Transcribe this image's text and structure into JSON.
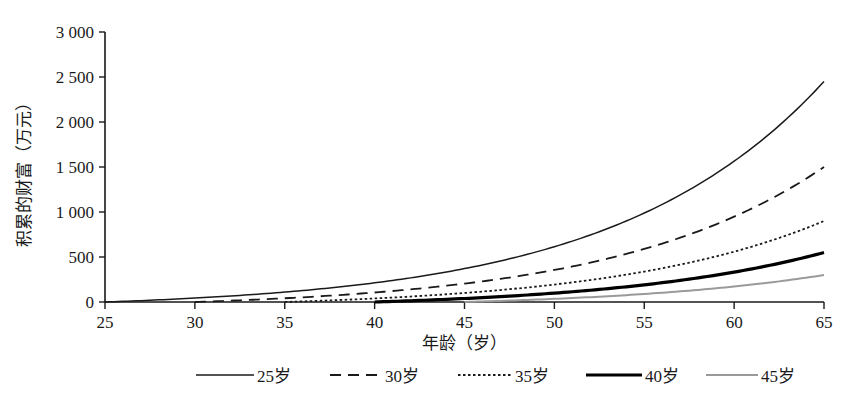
{
  "chart_data": {
    "type": "line",
    "title": "",
    "xlabel": "年龄（岁）",
    "ylabel": "积累的财富（万元）",
    "xlim": [
      25,
      65
    ],
    "ylim": [
      0,
      3000
    ],
    "grid": false,
    "legend_position": "bottom",
    "x_ticks": [
      "25",
      "30",
      "35",
      "40",
      "45",
      "50",
      "55",
      "60",
      "65"
    ],
    "x_tick_values": [
      25,
      30,
      35,
      40,
      45,
      50,
      55,
      60,
      65
    ],
    "y_ticks": [
      "0",
      "500",
      "1 000",
      "1 500",
      "2 000",
      "2 500",
      "3 000"
    ],
    "y_tick_values": [
      0,
      500,
      1000,
      1500,
      2000,
      2500,
      3000
    ],
    "x": [
      25,
      30,
      35,
      40,
      45,
      50,
      55,
      60,
      65
    ],
    "series": [
      {
        "name": "25岁",
        "style": "solid-thin",
        "color": "#1a1a1a",
        "start_age": 25,
        "values": [
          0,
          64,
          164,
          320,
          565,
          949,
          1550,
          2490,
          2450
        ],
        "points": [
          {
            "x": 25,
            "y": 0
          },
          {
            "x": 27,
            "y": 22
          },
          {
            "x": 30,
            "y": 64
          },
          {
            "x": 32,
            "y": 98
          },
          {
            "x": 35,
            "y": 164
          },
          {
            "x": 37,
            "y": 218
          },
          {
            "x": 40,
            "y": 320
          },
          {
            "x": 42,
            "y": 404
          },
          {
            "x": 45,
            "y": 565
          },
          {
            "x": 47,
            "y": 694
          },
          {
            "x": 50,
            "y": 949
          },
          {
            "x": 52,
            "y": 1152
          },
          {
            "x": 55,
            "y": 1000
          },
          {
            "x": 57,
            "y": 1230
          },
          {
            "x": 60,
            "y": 1680
          },
          {
            "x": 62,
            "y": 1980
          },
          {
            "x": 65,
            "y": 2450
          }
        ]
      },
      {
        "name": "30岁",
        "style": "dashed",
        "color": "#1a1a1a",
        "start_age": 30,
        "values": [
          null,
          0,
          64,
          164,
          320,
          565,
          560,
          960,
          1500
        ],
        "points": [
          {
            "x": 30,
            "y": 0
          },
          {
            "x": 35,
            "y": 60
          },
          {
            "x": 40,
            "y": 160
          },
          {
            "x": 45,
            "y": 300
          },
          {
            "x": 50,
            "y": 380
          },
          {
            "x": 55,
            "y": 560
          },
          {
            "x": 60,
            "y": 960
          },
          {
            "x": 65,
            "y": 1500
          }
        ]
      },
      {
        "name": "35岁",
        "style": "dotted",
        "color": "#1a1a1a",
        "start_age": 35,
        "values": [
          null,
          null,
          0,
          58,
          145,
          240,
          370,
          590,
          900
        ],
        "points": [
          {
            "x": 35,
            "y": 0
          },
          {
            "x": 40,
            "y": 58
          },
          {
            "x": 45,
            "y": 145
          },
          {
            "x": 50,
            "y": 240
          },
          {
            "x": 55,
            "y": 370
          },
          {
            "x": 60,
            "y": 590
          },
          {
            "x": 65,
            "y": 900
          }
        ]
      },
      {
        "name": "40岁",
        "style": "solid-thick",
        "color": "#000000",
        "start_age": 40,
        "values": [
          null,
          null,
          null,
          0,
          40,
          95,
          180,
          330,
          550
        ],
        "points": [
          {
            "x": 40,
            "y": 0
          },
          {
            "x": 45,
            "y": 40
          },
          {
            "x": 50,
            "y": 95
          },
          {
            "x": 55,
            "y": 180
          },
          {
            "x": 60,
            "y": 330
          },
          {
            "x": 65,
            "y": 550
          }
        ]
      },
      {
        "name": "45岁",
        "style": "solid-gray",
        "color": "#9a9a9a",
        "start_age": 45,
        "values": [
          null,
          null,
          null,
          null,
          0,
          35,
          100,
          185,
          300
        ],
        "points": [
          {
            "x": 45,
            "y": 0
          },
          {
            "x": 50,
            "y": 35
          },
          {
            "x": 55,
            "y": 100
          },
          {
            "x": 60,
            "y": 185
          },
          {
            "x": 65,
            "y": 300
          }
        ]
      }
    ],
    "legend": [
      {
        "label": "25岁",
        "style": "solid-thin",
        "color": "#1a1a1a"
      },
      {
        "label": "30岁",
        "style": "dashed",
        "color": "#1a1a1a"
      },
      {
        "label": "35岁",
        "style": "dotted",
        "color": "#1a1a1a"
      },
      {
        "label": "40岁",
        "style": "solid-thick",
        "color": "#000000"
      },
      {
        "label": "45岁",
        "style": "solid-gray",
        "color": "#9a9a9a"
      }
    ]
  }
}
